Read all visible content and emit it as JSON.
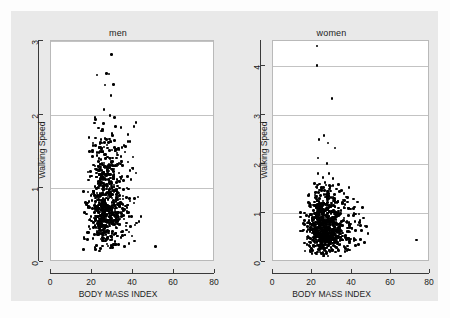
{
  "figure": {
    "background_color": "#e9e9e9",
    "plot_area_color": "#ffffff",
    "point_color": "#000000",
    "grid_color": "#c3c3c3",
    "axis_color": "#3a3a3a"
  },
  "chart_data": [
    {
      "type": "scatter",
      "title": "men",
      "xlabel": "BODY MASS INDEX",
      "ylabel": "Walking Speed",
      "xlim": [
        0,
        80
      ],
      "ylim": [
        0,
        3
      ],
      "xticks": [
        0,
        20,
        40,
        60,
        80
      ],
      "yticks": [
        0,
        1,
        2,
        3
      ],
      "xtick_labels": [
        "0",
        "20",
        "40",
        "60",
        "80"
      ],
      "ytick_labels": [
        "0",
        "1",
        "2",
        "3"
      ],
      "grid": true,
      "grid_axis": "y",
      "n_points": 760,
      "cluster": {
        "x_center": 26.5,
        "x_spread": 3.6,
        "x_skew": 1.5,
        "y_center": 0.78,
        "y_spread": 0.27,
        "y_skew": 1.9,
        "x_min": 14,
        "x_max": 46,
        "y_min": 0.15,
        "y_max": 2.0
      },
      "outliers": [
        {
          "x": 29.5,
          "y": 2.82
        },
        {
          "x": 22.5,
          "y": 2.54
        },
        {
          "x": 27.0,
          "y": 2.56
        },
        {
          "x": 28.3,
          "y": 2.55
        },
        {
          "x": 26.3,
          "y": 2.4
        },
        {
          "x": 30.5,
          "y": 2.41
        },
        {
          "x": 29.2,
          "y": 2.26
        },
        {
          "x": 25.8,
          "y": 2.07
        },
        {
          "x": 28.8,
          "y": 1.99
        },
        {
          "x": 23.3,
          "y": 1.82
        },
        {
          "x": 25.2,
          "y": 1.8
        },
        {
          "x": 24.6,
          "y": 1.78
        },
        {
          "x": 30.0,
          "y": 1.72
        },
        {
          "x": 28.5,
          "y": 1.67
        },
        {
          "x": 31.0,
          "y": 1.65
        },
        {
          "x": 26.0,
          "y": 1.62
        },
        {
          "x": 27.5,
          "y": 1.55
        },
        {
          "x": 29.8,
          "y": 1.52
        },
        {
          "x": 18.0,
          "y": 1.22
        },
        {
          "x": 38.5,
          "y": 1.24
        },
        {
          "x": 41.5,
          "y": 1.21
        },
        {
          "x": 39.0,
          "y": 1.12
        },
        {
          "x": 42.5,
          "y": 0.88
        },
        {
          "x": 40.5,
          "y": 0.8
        },
        {
          "x": 44.0,
          "y": 0.62
        },
        {
          "x": 43.0,
          "y": 0.55
        },
        {
          "x": 41.0,
          "y": 0.5
        },
        {
          "x": 51.0,
          "y": 0.21
        },
        {
          "x": 16.0,
          "y": 0.33
        },
        {
          "x": 38.0,
          "y": 0.25
        }
      ]
    },
    {
      "type": "scatter",
      "title": "women",
      "xlabel": "BODY MASS INDEX",
      "ylabel": "Walking Speed",
      "xlim": [
        0,
        80
      ],
      "ylim": [
        0,
        4.5
      ],
      "xticks": [
        0,
        20,
        40,
        60,
        80
      ],
      "yticks": [
        0,
        1,
        2,
        3,
        4
      ],
      "xtick_labels": [
        "0",
        "20",
        "40",
        "60",
        "80"
      ],
      "ytick_labels": [
        "0",
        "1",
        "2",
        "3",
        "4"
      ],
      "grid": true,
      "grid_axis": "y",
      "n_points": 880,
      "cluster": {
        "x_center": 26.0,
        "x_spread": 4.2,
        "x_skew": 1.6,
        "y_center": 0.66,
        "y_spread": 0.24,
        "y_skew": 1.9,
        "x_min": 14,
        "x_max": 48,
        "y_min": 0.12,
        "y_max": 1.6
      },
      "outliers": [
        {
          "x": 22.5,
          "y": 4.4
        },
        {
          "x": 22.5,
          "y": 4.0
        },
        {
          "x": 30.0,
          "y": 3.33
        },
        {
          "x": 23.5,
          "y": 2.5
        },
        {
          "x": 26.0,
          "y": 2.57
        },
        {
          "x": 28.0,
          "y": 2.42
        },
        {
          "x": 31.5,
          "y": 2.32
        },
        {
          "x": 23.0,
          "y": 2.12
        },
        {
          "x": 27.5,
          "y": 2.0
        },
        {
          "x": 23.0,
          "y": 1.8
        },
        {
          "x": 28.5,
          "y": 1.8
        },
        {
          "x": 25.5,
          "y": 1.72
        },
        {
          "x": 30.5,
          "y": 1.7
        },
        {
          "x": 21.0,
          "y": 1.6
        },
        {
          "x": 33.5,
          "y": 1.58
        },
        {
          "x": 26.5,
          "y": 1.62
        },
        {
          "x": 35.0,
          "y": 1.46
        },
        {
          "x": 41.0,
          "y": 1.28
        },
        {
          "x": 43.0,
          "y": 1.22
        },
        {
          "x": 39.5,
          "y": 1.08
        },
        {
          "x": 42.0,
          "y": 0.98
        },
        {
          "x": 46.0,
          "y": 0.9
        },
        {
          "x": 44.0,
          "y": 0.8
        },
        {
          "x": 47.5,
          "y": 0.72
        },
        {
          "x": 45.0,
          "y": 0.64
        },
        {
          "x": 48.5,
          "y": 0.58
        },
        {
          "x": 44.5,
          "y": 0.46
        },
        {
          "x": 46.5,
          "y": 0.4
        },
        {
          "x": 42.0,
          "y": 0.34
        },
        {
          "x": 43.5,
          "y": 0.36
        },
        {
          "x": 73.0,
          "y": 0.45
        },
        {
          "x": 16.0,
          "y": 1.0
        },
        {
          "x": 15.5,
          "y": 0.78
        }
      ]
    }
  ]
}
